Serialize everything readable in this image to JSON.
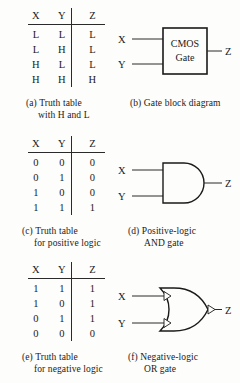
{
  "figure": {
    "background_color": "#fdfdfb",
    "ink_color": "#1a1a1a"
  },
  "tables": {
    "headers": [
      "X",
      "Y",
      "Z"
    ],
    "a": {
      "rows": [
        [
          "L",
          "L",
          "L"
        ],
        [
          "L",
          "H",
          "L"
        ],
        [
          "H",
          "L",
          "L"
        ],
        [
          "H",
          "H",
          "H"
        ]
      ]
    },
    "c": {
      "rows": [
        [
          "0",
          "0",
          "0"
        ],
        [
          "0",
          "1",
          "0"
        ],
        [
          "1",
          "0",
          "0"
        ],
        [
          "1",
          "1",
          "1"
        ]
      ]
    },
    "e": {
      "rows": [
        [
          "1",
          "1",
          "1"
        ],
        [
          "1",
          "0",
          "1"
        ],
        [
          "0",
          "1",
          "1"
        ],
        [
          "0",
          "0",
          "0"
        ]
      ]
    }
  },
  "captions": {
    "a": {
      "line1": "(a) Truth table",
      "line2": "with H and L"
    },
    "b": {
      "line1": "(b) Gate block diagram",
      "line2": ""
    },
    "c": {
      "line1": "(c) Truth table",
      "line2": "for positive logic"
    },
    "d": {
      "line1": "(d) Positive-logic",
      "line2": "AND gate"
    },
    "e": {
      "line1": "(e) Truth table",
      "line2": "for negative logic"
    },
    "f": {
      "line1": "(f) Negative-logic",
      "line2": "OR gate"
    }
  },
  "gates": {
    "block": {
      "label_line1": "CMOS",
      "label_line2": "Gate",
      "input_x": "X",
      "input_y": "Y",
      "output_z": "Z"
    },
    "and": {
      "input_x": "X",
      "input_y": "Y",
      "output_z": "Z"
    },
    "or": {
      "input_x": "X",
      "input_y": "Y",
      "output_z": "Z"
    }
  }
}
